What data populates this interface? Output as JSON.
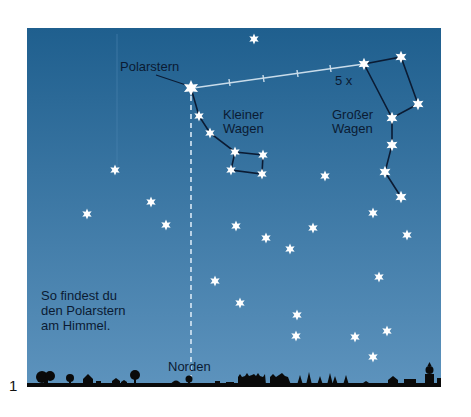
{
  "figure_number": "1",
  "labels": {
    "polaris": "Polarstern",
    "pointer": "5 x",
    "little_dipper_line1": "Kleiner",
    "little_dipper_line2": "Wagen",
    "big_dipper_line1": "Großer",
    "big_dipper_line2": "Wagen",
    "north": "Norden",
    "caption_line1": "So findest du",
    "caption_line2": "den Polarstern",
    "caption_line3": "am Himmel."
  },
  "colors": {
    "sky_top": "#1f5f8e",
    "sky_bottom": "#5d93bd",
    "star": "#ffffff",
    "constellation_line": "#0b1b33",
    "pointer_line": "#c9dcea",
    "silhouette": "#0a0a0a",
    "text": "#0b1b33"
  },
  "pointer_line": {
    "multiplier": 5
  },
  "constellations": [
    {
      "name": "little-dipper",
      "stars": [
        "polaris",
        "ld1",
        "ld2",
        "ld3",
        "ld4",
        "ld5",
        "ld6"
      ]
    },
    {
      "name": "big-dipper",
      "stars": [
        "bd1",
        "bd2",
        "bd3",
        "bd4",
        "bd5",
        "bd6",
        "bd7"
      ]
    }
  ]
}
